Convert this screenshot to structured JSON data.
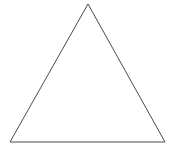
{
  "diagram": {
    "shape": "triangle",
    "type": "equilateral",
    "stroke_color": "#4a4a4a",
    "fill_color": "#ffffff",
    "background": "#ffffff",
    "vertices": {
      "apex": [
        88,
        4
      ],
      "bottom_left": [
        10,
        142
      ],
      "bottom_right": [
        165,
        142
      ]
    }
  }
}
